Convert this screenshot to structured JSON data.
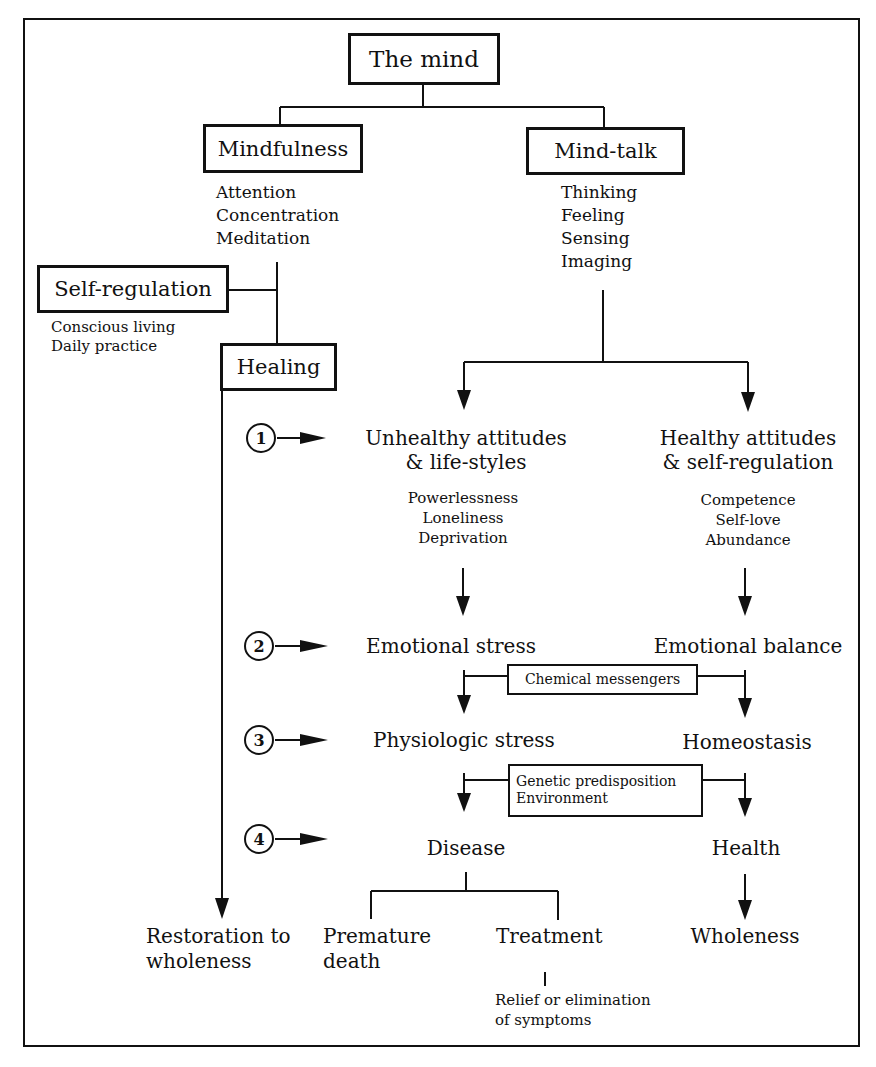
{
  "root": {
    "label": "The mind"
  },
  "branches": {
    "mindfulness": {
      "label": "Mindfulness",
      "items": [
        "Attention",
        "Concentration",
        "Meditation"
      ]
    },
    "mind_talk": {
      "label": "Mind-talk",
      "items": [
        "Thinking",
        "Feeling",
        "Sensing",
        "Imaging"
      ]
    },
    "self_regulation": {
      "label": "Self-regulation",
      "items": [
        "Conscious living",
        "Daily practice"
      ]
    },
    "healing": {
      "label": "Healing",
      "outcome_line1": "Restoration to",
      "outcome_line2": "wholeness"
    }
  },
  "steps": [
    {
      "number": "1",
      "left": {
        "line1": "Unhealthy attitudes",
        "line2": "& life-styles",
        "items": [
          "Powerlessness",
          "Loneliness",
          "Deprivation"
        ]
      },
      "right": {
        "line1": "Healthy attitudes",
        "line2": "& self-regulation",
        "items": [
          "Competence",
          "Self-love",
          "Abundance"
        ]
      }
    },
    {
      "number": "2",
      "left": {
        "line1": "Emotional stress"
      },
      "right": {
        "line1": "Emotional balance"
      }
    },
    {
      "number": "3",
      "left": {
        "line1": "Physiologic stress"
      },
      "right": {
        "line1": "Homeostasis"
      }
    },
    {
      "number": "4",
      "left": {
        "line1": "Disease"
      },
      "right": {
        "line1": "Health"
      }
    }
  ],
  "connectors": {
    "chemical": "Chemical messengers",
    "genetic_line1": "Genetic predisposition",
    "genetic_line2": "Environment"
  },
  "outcomes": {
    "premature_line1": "Premature",
    "premature_line2": "death",
    "treatment": "Treatment",
    "relief_line1": "Relief or elimination",
    "relief_line2": "of symptoms",
    "wholeness": "Wholeness"
  }
}
